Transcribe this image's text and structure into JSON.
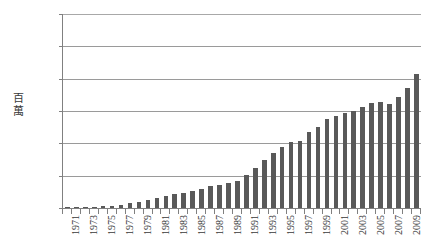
{
  "chart_data": {
    "type": "bar",
    "title": "",
    "xlabel": "",
    "ylabel": "百萬",
    "ylim": [
      0,
      120
    ],
    "ytick_values": [
      0,
      20,
      40,
      60,
      80,
      100,
      120
    ],
    "ytick_labels": [
      "0",
      "20",
      "40",
      "60",
      "80",
      "100",
      "120"
    ],
    "grid": true,
    "legend": "none",
    "bar_color": "#595959",
    "axis_color": "#808080",
    "gridline_color": "#9a9a9a",
    "categories": [
      "1971",
      "1972",
      "1973",
      "1974",
      "1975",
      "1976",
      "1977",
      "1978",
      "1979",
      "1980",
      "1981",
      "1982",
      "1983",
      "1984",
      "1985",
      "1986",
      "1987",
      "1988",
      "1989",
      "1990",
      "1991",
      "1992",
      "1993",
      "1994",
      "1995",
      "1996",
      "1997",
      "1998",
      "1999",
      "2000",
      "2001",
      "2002",
      "2003",
      "2004",
      "2005",
      "2006",
      "2007",
      "2008",
      "2009",
      "2010"
    ],
    "xtick_labels_shown": [
      "1971",
      "1973",
      "1975",
      "1977",
      "1979",
      "1981",
      "1983",
      "1985",
      "1987",
      "1989",
      "1991",
      "1993",
      "1995",
      "1997",
      "1999",
      "2001",
      "2003",
      "2005",
      "2007",
      "2009"
    ],
    "values": [
      0.3,
      0.4,
      0.5,
      0.7,
      1.0,
      1.4,
      2.0,
      2.8,
      4.0,
      5.2,
      6.5,
      7.2,
      8.5,
      9.5,
      10.5,
      12.0,
      13.5,
      14.5,
      15.5,
      17.0,
      20.5,
      25.0,
      30.0,
      34.0,
      38.0,
      41.0,
      41.5,
      47.0,
      50.0,
      55.0,
      57.0,
      58.5,
      60.0,
      62.5,
      65.0,
      65.5,
      64.5,
      68.5,
      74.0,
      83.0
    ]
  }
}
